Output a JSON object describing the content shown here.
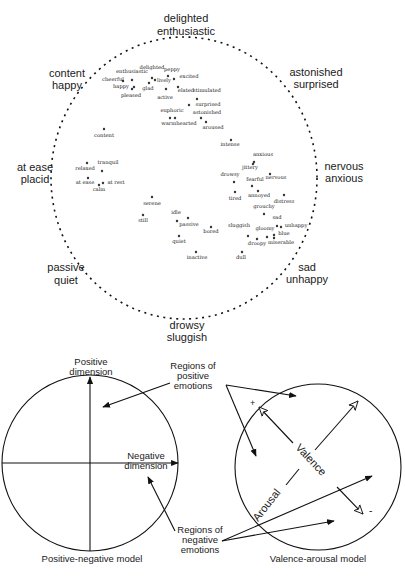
{
  "circumplex": {
    "anchors": {
      "top": [
        "delighted",
        "enthusiastic"
      ],
      "top_right": [
        "astonished",
        "surprised"
      ],
      "right": [
        "nervous",
        "anxious"
      ],
      "bottom_right": [
        "sad",
        "unhappy"
      ],
      "bottom": [
        "drowsy",
        "sluggish"
      ],
      "bottom_left": [
        "passive",
        "quiet"
      ],
      "left": [
        "at ease",
        "placid"
      ],
      "top_left": [
        "content",
        "happy"
      ]
    },
    "words": [
      {
        "label": "enthusiastic",
        "x": 132,
        "y": 80,
        "dx": 132,
        "dy": 73
      },
      {
        "label": "delighted",
        "x": 152,
        "y": 78,
        "dx": 152,
        "dy": 69
      },
      {
        "label": "peppy",
        "x": 168,
        "y": 76,
        "dx": 172,
        "dy": 71
      },
      {
        "label": "cheerful",
        "x": 123,
        "y": 81,
        "dx": 113,
        "dy": 81
      },
      {
        "label": "excited",
        "x": 174,
        "y": 79,
        "dx": 189,
        "dy": 78
      },
      {
        "label": "lively",
        "x": 155,
        "y": 80,
        "dx": 164,
        "dy": 82
      },
      {
        "label": "happy",
        "x": 134,
        "y": 87,
        "dx": 121,
        "dy": 88
      },
      {
        "label": "glad",
        "x": 149,
        "y": 83,
        "dx": 148,
        "dy": 90
      },
      {
        "label": "pleased",
        "x": 132,
        "y": 89,
        "dx": 131,
        "dy": 97
      },
      {
        "label": "active",
        "x": 166,
        "y": 89,
        "dx": 165,
        "dy": 99
      },
      {
        "label": "elated",
        "x": 178,
        "y": 87,
        "dx": 186,
        "dy": 92
      },
      {
        "label": "stimulated",
        "x": 197,
        "y": 99,
        "dx": 207,
        "dy": 92
      },
      {
        "label": "surprised",
        "x": 189,
        "y": 105,
        "dx": 208,
        "dy": 106
      },
      {
        "label": "euphoric",
        "x": 170,
        "y": 118,
        "dx": 172,
        "dy": 112
      },
      {
        "label": "astonished",
        "x": 201,
        "y": 118,
        "dx": 207,
        "dy": 114
      },
      {
        "label": "warmhearted",
        "x": 175,
        "y": 118,
        "dx": 179,
        "dy": 125
      },
      {
        "label": "aroused",
        "x": 206,
        "y": 122,
        "dx": 213,
        "dy": 129
      },
      {
        "label": "content",
        "x": 104,
        "y": 129,
        "dx": 104,
        "dy": 137
      },
      {
        "label": "intense",
        "x": 231,
        "y": 140,
        "dx": 230,
        "dy": 146
      },
      {
        "label": "anxious",
        "x": 254,
        "y": 162,
        "dx": 263,
        "dy": 156
      },
      {
        "label": "jittery",
        "x": 253,
        "y": 164,
        "dx": 250,
        "dy": 169
      },
      {
        "label": "drowsy",
        "x": 234,
        "y": 182,
        "dx": 230,
        "dy": 176
      },
      {
        "label": "nervous",
        "x": 270,
        "y": 174,
        "dx": 276,
        "dy": 179
      },
      {
        "label": "fearful",
        "x": 252,
        "y": 186,
        "dx": 255,
        "dy": 181
      },
      {
        "label": "tired",
        "x": 235,
        "y": 192,
        "dx": 235,
        "dy": 200
      },
      {
        "label": "annoyed",
        "x": 258,
        "y": 191,
        "dx": 259,
        "dy": 197
      },
      {
        "label": "distress",
        "x": 284,
        "y": 195,
        "dx": 284,
        "dy": 203
      },
      {
        "label": "grouchy",
        "x": 264,
        "y": 214,
        "dx": 264,
        "dy": 208
      },
      {
        "label": "sad",
        "x": 277,
        "y": 226,
        "dx": 277,
        "dy": 219
      },
      {
        "label": "unhappy",
        "x": 281,
        "y": 227,
        "dx": 296,
        "dy": 227
      },
      {
        "label": "sluggish",
        "x": 248,
        "y": 236,
        "dx": 239,
        "dy": 227
      },
      {
        "label": "gloomy",
        "x": 257,
        "y": 239,
        "dx": 265,
        "dy": 230
      },
      {
        "label": "blue",
        "x": 274,
        "y": 235,
        "dx": 284,
        "dy": 235
      },
      {
        "label": "droopy",
        "x": 267,
        "y": 237,
        "dx": 257,
        "dy": 245
      },
      {
        "label": "miserable",
        "x": 274,
        "y": 238,
        "dx": 281,
        "dy": 244
      },
      {
        "label": "dull",
        "x": 242,
        "y": 252,
        "dx": 241,
        "dy": 259
      },
      {
        "label": "relaxed",
        "x": 87,
        "y": 163,
        "dx": 85,
        "dy": 170
      },
      {
        "label": "tranquil",
        "x": 102,
        "y": 171,
        "dx": 108,
        "dy": 164
      },
      {
        "label": "at ease",
        "x": 88,
        "y": 178,
        "dx": 85,
        "dy": 184
      },
      {
        "label": "calm",
        "x": 99,
        "y": 185,
        "dx": 99,
        "dy": 191
      },
      {
        "label": "at rest",
        "x": 103,
        "y": 183,
        "dx": 116,
        "dy": 184
      },
      {
        "label": "serene",
        "x": 152,
        "y": 197,
        "dx": 152,
        "dy": 205
      },
      {
        "label": "still",
        "x": 143,
        "y": 215,
        "dx": 143,
        "dy": 222
      },
      {
        "label": "idle",
        "x": 177,
        "y": 221,
        "dx": 176,
        "dy": 214
      },
      {
        "label": "passive",
        "x": 188,
        "y": 218,
        "dx": 189,
        "dy": 226
      },
      {
        "label": "bored",
        "x": 211,
        "y": 227,
        "dx": 211,
        "dy": 233
      },
      {
        "label": "quiet",
        "x": 179,
        "y": 236,
        "dx": 179,
        "dy": 243
      },
      {
        "label": "inactive",
        "x": 196,
        "y": 252,
        "dx": 197,
        "dy": 259
      }
    ]
  },
  "positive_negative_model": {
    "caption": "Positive-negative model",
    "axis_vertical": [
      "Positive",
      "dimension"
    ],
    "axis_horizontal": [
      "Negative",
      "dimension"
    ],
    "callout_positive": [
      "Regions of",
      "positive",
      "emotions"
    ],
    "callout_negative": [
      "Regions of",
      "negative",
      "emotions"
    ]
  },
  "valence_arousal_model": {
    "caption": "Valence-arousal model",
    "axis_valence": "Valence",
    "axis_arousal": "Arousal",
    "plus_marker": "+",
    "minus_marker": "-"
  },
  "colors": {
    "ink": "#111111",
    "background": "#ffffff"
  }
}
